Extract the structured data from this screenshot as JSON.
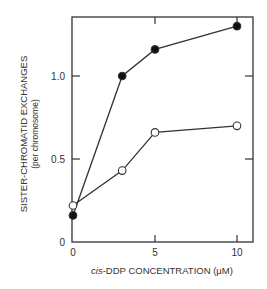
{
  "chart_data": {
    "type": "line",
    "title": "",
    "xlabel_prefix": "cis",
    "xlabel_rest": "-DDP CONCENTRATION (μM)",
    "xlabel": "cis-DDP CONCENTRATION (μM)",
    "ylabel": "SISTER-CHROMATID EXCHANGES",
    "ylabel_sub": "(per chromosome)",
    "x_ticks": [
      0,
      5,
      10
    ],
    "x_tick_labels": [
      "0",
      "5",
      "10"
    ],
    "y_ticks": [
      0,
      0.5,
      1.0
    ],
    "y_tick_labels": [
      "0",
      "0.5",
      "1.0"
    ],
    "xlim": [
      0,
      11
    ],
    "ylim": [
      0,
      1.35
    ],
    "grid": false,
    "legend": "none",
    "series": [
      {
        "name": "filled circles",
        "marker": "filled-circle",
        "x": [
          0,
          3,
          5,
          10
        ],
        "values": [
          0.16,
          1.0,
          1.16,
          1.3
        ]
      },
      {
        "name": "open circles",
        "marker": "open-circle",
        "x": [
          0,
          3,
          5,
          10
        ],
        "values": [
          0.22,
          0.43,
          0.66,
          0.7
        ]
      }
    ]
  },
  "colors": {
    "line": "#333333",
    "marker_fill": "#111111",
    "open_marker_fill": "#ffffff"
  }
}
